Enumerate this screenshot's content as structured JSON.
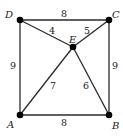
{
  "diagram": {
    "type": "weighted-graph",
    "vertices": [
      {
        "id": "A",
        "label": "A",
        "x": 20,
        "y": 115,
        "lx": 8,
        "ly": 129
      },
      {
        "id": "B",
        "label": "B",
        "x": 109,
        "y": 115,
        "lx": 113,
        "ly": 130
      },
      {
        "id": "C",
        "label": "C",
        "x": 109,
        "y": 20,
        "lx": 113,
        "ly": 20
      },
      {
        "id": "D",
        "label": "D",
        "x": 20,
        "y": 20,
        "lx": 5,
        "ly": 20
      },
      {
        "id": "E",
        "label": "E",
        "x": 73,
        "y": 47,
        "lx": 69,
        "ly": 43
      }
    ],
    "edges": [
      {
        "from": "D",
        "to": "C",
        "weight": "8",
        "wx": 62,
        "wy": 18
      },
      {
        "from": "D",
        "to": "E",
        "weight": "4",
        "wx": 50,
        "wy": 34
      },
      {
        "from": "E",
        "to": "C",
        "weight": "5",
        "wx": 84,
        "wy": 34
      },
      {
        "from": "D",
        "to": "A",
        "weight": "9",
        "wx": 10,
        "wy": 69
      },
      {
        "from": "C",
        "to": "B",
        "weight": "9",
        "wx": 112,
        "wy": 69
      },
      {
        "from": "A",
        "to": "E",
        "weight": "7",
        "wx": 50,
        "wy": 88
      },
      {
        "from": "E",
        "to": "B",
        "weight": "6",
        "wx": 83,
        "wy": 88
      },
      {
        "from": "A",
        "to": "B",
        "weight": "8",
        "wx": 62,
        "wy": 126
      }
    ]
  }
}
